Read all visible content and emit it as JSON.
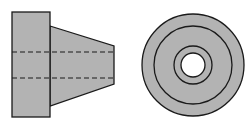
{
  "diagram": {
    "type": "orthographic-projection",
    "views": [
      {
        "name": "side-view",
        "shape": "flanged tapered cylinder with hidden bore lines"
      },
      {
        "name": "end-view",
        "shape": "concentric circles with central hole"
      }
    ],
    "colors": {
      "fill": "#b3b3b3",
      "stroke": "#1a1a1a",
      "background": "#ffffff",
      "hole": "#ffffff"
    }
  }
}
